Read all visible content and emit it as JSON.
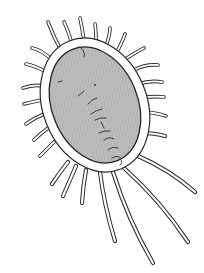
{
  "image": {
    "subject": "line drawing of an oval spined micro-organism with long trailing tendrils",
    "colors": {
      "background": "#ffffff",
      "body_fill": "#b9b9b9",
      "line": "#2a2a2a",
      "membrane_fill": "#ffffff"
    },
    "caption": ""
  }
}
